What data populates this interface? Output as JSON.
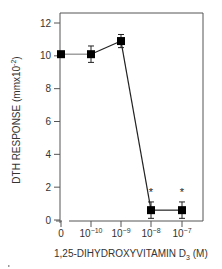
{
  "chart_data": {
    "type": "line",
    "title": "",
    "xlabel": "1,25-DIHYDROXYVITAMIN D3 (M)",
    "xlabel_parts": {
      "main": "1,25-DIHYDROXYVITAMIN D",
      "sub": "3",
      "suffix": " (M)"
    },
    "ylabel": "DTH RESPONSE (mmx10-2)",
    "ylabel_parts": {
      "main": "DTH RESPONSE (mmx10",
      "sup": "-2",
      "suffix": ")"
    },
    "categories": [
      "0",
      "10^-10",
      "10^-9",
      "10^-8",
      "10^-7"
    ],
    "x_tick_labels": [
      {
        "base": "0",
        "exp": ""
      },
      {
        "base": "10",
        "exp": "−10"
      },
      {
        "base": "10",
        "exp": "−9"
      },
      {
        "base": "10",
        "exp": "−8"
      },
      {
        "base": "10",
        "exp": "−7"
      }
    ],
    "y_ticks": [
      0,
      2,
      4,
      6,
      8,
      10,
      12
    ],
    "ylim": [
      0,
      12
    ],
    "grid": false,
    "legend": null,
    "series": [
      {
        "name": "DTH response",
        "values": [
          10.1,
          10.1,
          10.9,
          0.6,
          0.6
        ],
        "error": [
          0,
          0.5,
          0.4,
          0.5,
          0.5
        ],
        "marker": "square",
        "color": "#000000"
      }
    ],
    "annotations": [
      {
        "category": "10^-8",
        "text": "*"
      },
      {
        "category": "10^-7",
        "text": "*"
      }
    ]
  },
  "colors": {
    "axis": "#555555",
    "line": "#222222",
    "first_segment": "#888888",
    "marker": "#000000"
  }
}
